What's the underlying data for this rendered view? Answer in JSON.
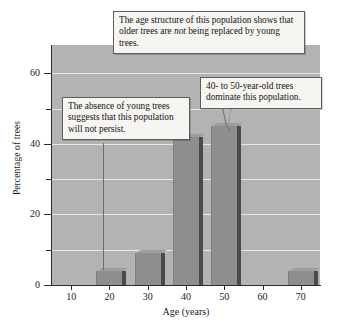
{
  "chart_data": {
    "type": "bar",
    "title": "",
    "xlabel": "Age (years)",
    "ylabel": "Percentage of trees",
    "categories": [
      10,
      20,
      30,
      40,
      50,
      60,
      70
    ],
    "values": [
      0,
      4,
      9,
      42,
      45,
      0,
      4
    ],
    "xlim": [
      5,
      75
    ],
    "ylim": [
      0,
      68
    ],
    "y_ticks_major": [
      0,
      20,
      40,
      60
    ],
    "y_ticks_minor": [
      10,
      30,
      50
    ],
    "x_ticks": [
      10,
      20,
      30,
      40,
      50,
      60,
      70
    ],
    "grid": true,
    "grid_orientation": "horizontal",
    "legend": "none",
    "plot_bg_color": "#b3b3b3",
    "bar_color": "#8e8e8e",
    "bar_shadow_color": "#4a4a4a",
    "annotations": [
      {
        "id": "age-structure",
        "text_before": "The age structure of this population shows that older trees are ",
        "emphasis": "not",
        "text_after": " being replaced by young trees.",
        "points_to": "overall"
      },
      {
        "id": "absence-young",
        "text": "The absence of young trees suggests that this population will not persist.",
        "points_to": 20
      },
      {
        "id": "dominant",
        "text": "40- to 50-year-old trees dominate this population.",
        "points_to": 50
      }
    ]
  },
  "axes": {
    "y_title": "Percentage of trees",
    "x_title": "Age (years)",
    "y_tick_labels": [
      "0",
      "20",
      "40",
      "60"
    ],
    "x_tick_labels": [
      "10",
      "20",
      "30",
      "40",
      "50",
      "60",
      "70"
    ]
  },
  "callouts": {
    "age_structure": {
      "part1": "The age structure of this population shows that older trees are ",
      "emphasis": "not",
      "part2": " being replaced by young trees."
    },
    "absence_young": "The absence of young trees suggests that this population will not persist.",
    "dominant": "40- to 50-year-old trees dominate this population."
  }
}
